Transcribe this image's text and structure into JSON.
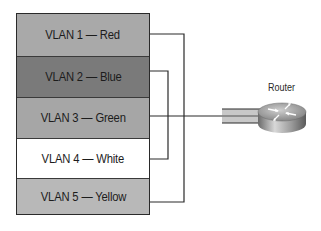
{
  "diagram": {
    "type": "vlan-switch-to-router",
    "switch": {
      "vlans": [
        {
          "label": "VLAN 1 — Red",
          "color": "#a9a9a9"
        },
        {
          "label": "VLAN 2 — Blue",
          "color": "#7a7a7a"
        },
        {
          "label": "VLAN 3 — Green",
          "color": "#a6a6a6"
        },
        {
          "label": "VLAN 4 — White",
          "color": "#ffffff"
        },
        {
          "label": "VLAN 5 — Yellow",
          "color": "#b8b8b8"
        }
      ]
    },
    "router": {
      "label": "Router"
    },
    "connections": [
      {
        "from": "VLAN 1 — Red",
        "to": "VLAN 5 — Yellow",
        "kind": "outer-loop"
      },
      {
        "from": "VLAN 2 — Blue",
        "to": "VLAN 4 — White",
        "kind": "inner-loop"
      },
      {
        "from": "VLAN 3 — Green",
        "to": "Router",
        "kind": "trunk-link"
      }
    ]
  }
}
